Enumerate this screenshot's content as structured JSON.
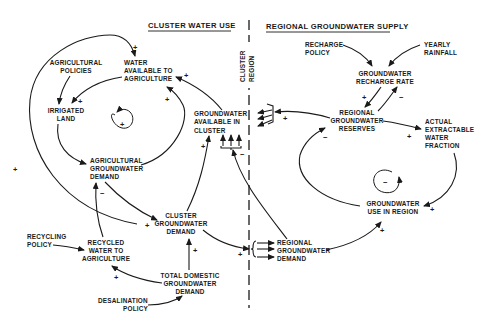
{
  "sections": {
    "left_title": "CLUSTER WATER USE",
    "right_title": "REGIONAL GROUNDWATER SUPPLY",
    "divider_labels": [
      "CLUSTER",
      "REGION"
    ]
  },
  "nodes": {
    "agricultural_policies": [
      "AGRICULTURAL",
      "POLICIES"
    ],
    "water_available": [
      "WATER",
      "AVAILABLE TO",
      "AGRICULTURE"
    ],
    "irrigated_land": [
      "IRRIGATED",
      "LAND"
    ],
    "ag_demand": [
      "AGRICULTURAL",
      "GROUNDWATER",
      "DEMAND"
    ],
    "gw_available_cluster": [
      "GROUNDWATER",
      "AVAILABLE IN",
      "CLUSTER"
    ],
    "cluster_demand": [
      "CLUSTER",
      "GROUNDWATER",
      "DEMAND"
    ],
    "recycling_policy": [
      "RECYCLING",
      "POLICY"
    ],
    "recycled_water": [
      "RECYCLED",
      "WATER TO",
      "AGRICULTURE"
    ],
    "total_domestic": [
      "TOTAL DOMESTIC",
      "GROUNDWATER",
      "DEMAND"
    ],
    "desalination_policy": [
      "DESALINATION",
      "POLICY"
    ],
    "recharge_policy": [
      "RECHARGE",
      "POLICY"
    ],
    "yearly_rainfall": [
      "YEARLY",
      "RAINFALL"
    ],
    "recharge_rate": [
      "GROUNDWATER",
      "RECHARGE RATE"
    ],
    "regional_reserves": [
      "REGIONAL",
      "GROUNDWATER",
      "RESERVES"
    ],
    "extractable_fraction": [
      "ACTUAL",
      "EXTRACTABLE",
      "WATER",
      "FRACTION"
    ],
    "gw_use_region": [
      "GROUNDWATER",
      "USE IN REGION"
    ],
    "regional_demand": [
      "REGIONAL",
      "GROUNDWATER",
      "DEMAND"
    ]
  },
  "loops": {
    "left_loop_polarity": "+",
    "right_loop_polarity": "−"
  },
  "signs": {
    "outer_to_water": "+",
    "gwcluster_to_water": "+",
    "water_to_irrigated": "+",
    "ag_to_water": "+",
    "irrigated_to_ag": "+",
    "ag_to_cluster": "+",
    "cluster_to_gwcluster": "+",
    "regional_to_gwcluster": "−",
    "recycled_to_ag": "−",
    "recycled_to_cluster": "+",
    "domestic_to_cluster": "+",
    "domestic_to_recycled": "+",
    "cluster_to_regional": "+",
    "reserves_to_cluster": "+",
    "rate_to_reserves": "+",
    "reserves_to_rate": "−",
    "reserves_to_fraction": "+",
    "use_to_reserves": "−",
    "fraction_to_use": "+",
    "regionaldemand_to_use": "+"
  }
}
